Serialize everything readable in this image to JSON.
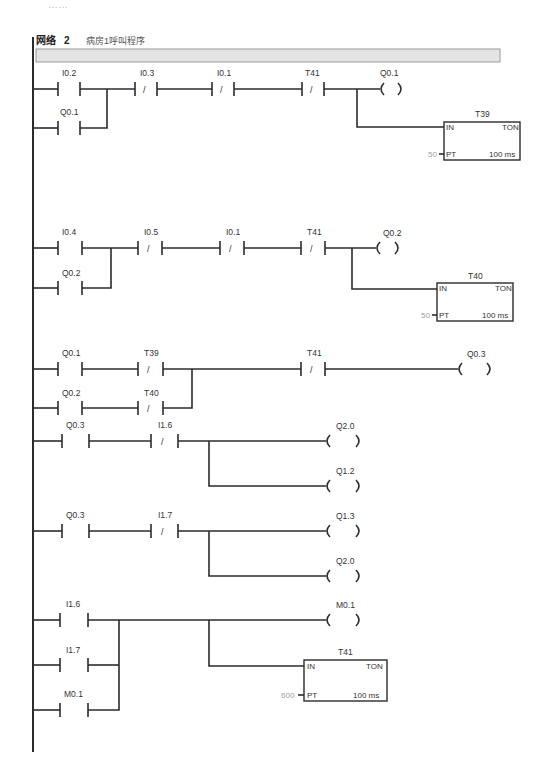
{
  "header": {
    "top_faint_text": "……",
    "network_label": "网络",
    "network_number": "2",
    "network_comment": "病房1呼叫程序"
  },
  "rungs": [
    {
      "contacts": [
        {
          "addr": "I0.2",
          "type": "NO"
        },
        {
          "addr": "Q0.1",
          "type": "NO",
          "branch": true
        },
        {
          "addr": "I0.3",
          "type": "NC"
        },
        {
          "addr": "I0.1",
          "type": "NC"
        },
        {
          "addr": "T41",
          "type": "NC"
        }
      ],
      "coil": "Q0.1",
      "timer": {
        "name": "T39",
        "type": "TON",
        "in": "IN",
        "pt_label": "PT",
        "pt_value": "50",
        "base": "100 ms"
      }
    },
    {
      "contacts": [
        {
          "addr": "I0.4",
          "type": "NO"
        },
        {
          "addr": "Q0.2",
          "type": "NO",
          "branch": true
        },
        {
          "addr": "I0.5",
          "type": "NC"
        },
        {
          "addr": "I0.1",
          "type": "NC"
        },
        {
          "addr": "T41",
          "type": "NC"
        }
      ],
      "coil": "Q0.2",
      "timer": {
        "name": "T40",
        "type": "TON",
        "in": "IN",
        "pt_label": "PT",
        "pt_value": "50",
        "base": "100 ms"
      }
    },
    {
      "contacts": [
        {
          "addr": "Q0.1",
          "type": "NO"
        },
        {
          "addr": "T39",
          "type": "NC"
        },
        {
          "addr": "Q0.2",
          "type": "NO",
          "branch": true
        },
        {
          "addr": "T40",
          "type": "NC",
          "branch": true
        },
        {
          "addr": "T41",
          "type": "NC"
        }
      ],
      "coil": "Q0.3"
    },
    {
      "contacts": [
        {
          "addr": "Q0.3",
          "type": "NO"
        },
        {
          "addr": "I1.6",
          "type": "NC"
        }
      ],
      "coils": [
        "Q2.0",
        "Q1.2"
      ]
    },
    {
      "contacts": [
        {
          "addr": "Q0.3",
          "type": "NO"
        },
        {
          "addr": "I1.7",
          "type": "NC"
        }
      ],
      "coils": [
        "Q1.3",
        "Q2.0"
      ]
    },
    {
      "contacts": [
        {
          "addr": "I1.6",
          "type": "NO"
        },
        {
          "addr": "I1.7",
          "type": "NO",
          "branch": true
        },
        {
          "addr": "M0.1",
          "type": "NO",
          "branch": true
        }
      ],
      "coil": "M0.1",
      "timer": {
        "name": "T41",
        "type": "TON",
        "in": "IN",
        "pt_label": "PT",
        "pt_value": "600",
        "base": "100 ms"
      }
    }
  ],
  "symbols": {
    "nc_mark": "/",
    "coil_open": "(",
    "coil_close": ")"
  },
  "colors": {
    "wire": "#2b2b2b",
    "comment_bar": "#e4e4e4",
    "pt_value": "#a0a0a0",
    "background": "#ffffff"
  }
}
